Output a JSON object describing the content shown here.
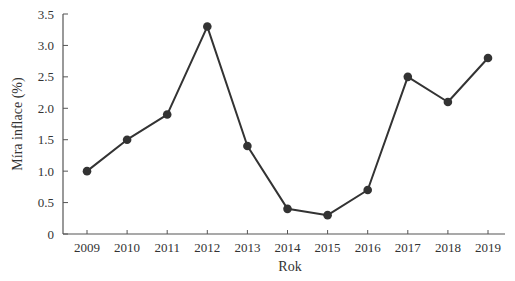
{
  "chart_data": {
    "type": "line",
    "title": "",
    "xlabel": "Rok",
    "ylabel": "Míra inflace (%)",
    "categories": [
      "2009",
      "2010",
      "2011",
      "2012",
      "2013",
      "2014",
      "2015",
      "2016",
      "2017",
      "2018",
      "2019"
    ],
    "series": [
      {
        "name": "Míra inflace",
        "values": [
          1.0,
          1.5,
          1.9,
          3.3,
          1.4,
          0.4,
          0.3,
          0.7,
          2.5,
          2.1,
          2.8
        ],
        "color": "#333333",
        "marker": "circle"
      }
    ],
    "ylim": [
      0,
      3.5
    ],
    "yticks": [
      "0",
      "0.5",
      "1.0",
      "1.5",
      "2.0",
      "2.5",
      "3.0",
      "3.5"
    ],
    "grid": false,
    "legend": "none"
  },
  "colors": {
    "line": "#333333",
    "axis": "#555555",
    "text": "#333333",
    "background": "#ffffff"
  }
}
